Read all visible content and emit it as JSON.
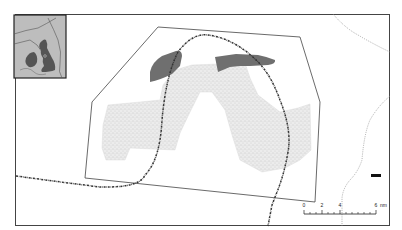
{
  "map": {
    "inset": {
      "description": "British Isles locator map",
      "land_color": "#555555",
      "background_color": "#bdbdbd"
    },
    "study_area_polygon": {
      "stroke": "#333333"
    },
    "stippled_area": {
      "fill": "#e6e6e6"
    },
    "dark_patches": {
      "fill": "#6e6e6e",
      "count": 2
    },
    "route_line": {
      "style": "dash-dot",
      "color": "#333333"
    },
    "contour_line": {
      "style": "dotted",
      "color": "#888888"
    },
    "marker": {
      "color": "#111111"
    },
    "scale_bar": {
      "labels": [
        "0",
        "2",
        "4",
        "6"
      ],
      "unit": "nm",
      "last_label": "6 nm"
    }
  }
}
